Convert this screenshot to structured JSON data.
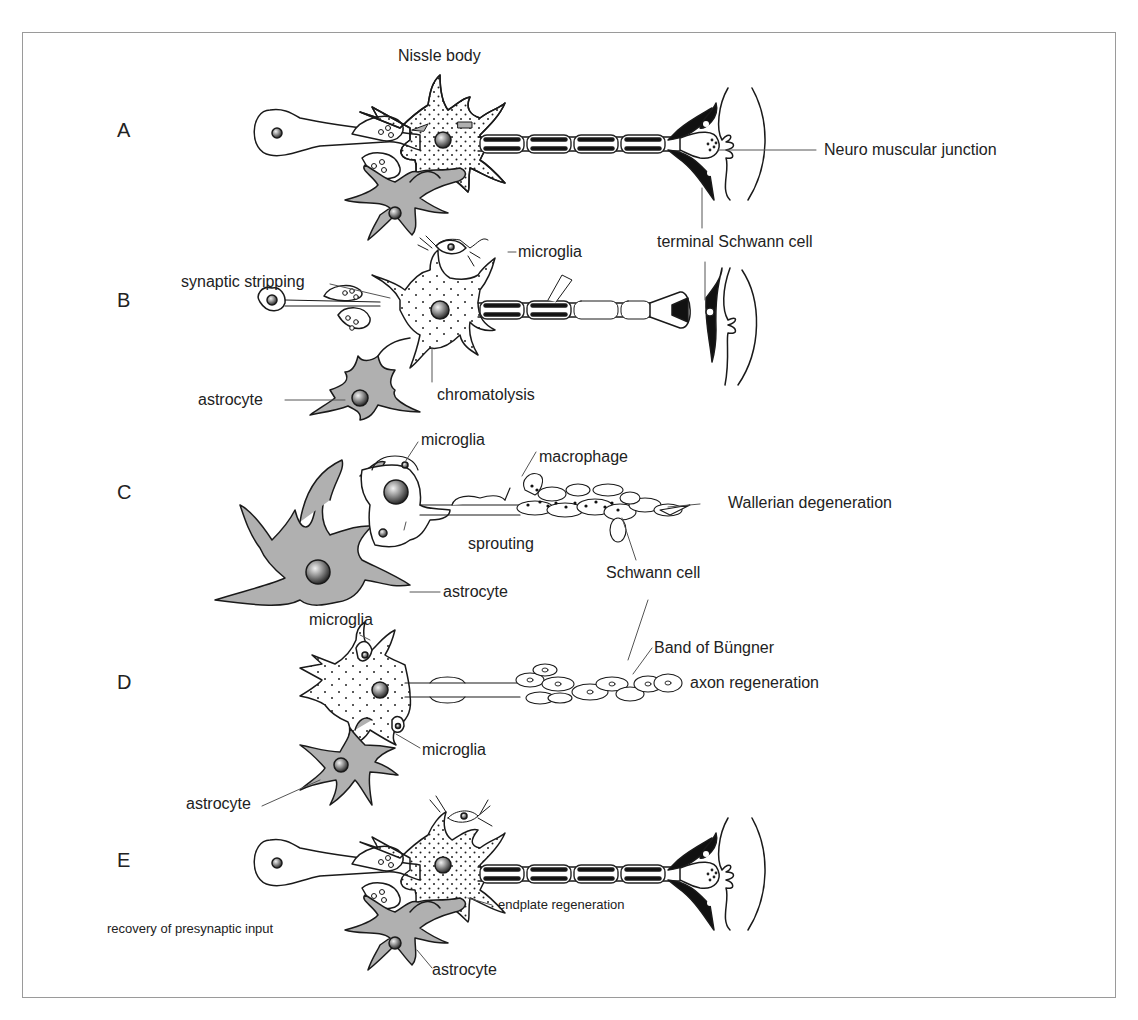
{
  "figure": {
    "rows": [
      {
        "letter": "A",
        "labels": {
          "nissle_body": "Nissle body",
          "nmj": "Neuro muscular junction",
          "terminal_schwann": "terminal Schwann cell"
        }
      },
      {
        "letter": "B",
        "labels": {
          "microglia": "microglia",
          "synaptic_stripping": "synaptic stripping",
          "astrocyte": "astrocyte",
          "chromatolysis": "chromatolysis"
        }
      },
      {
        "letter": "C",
        "labels": {
          "microglia": "microglia",
          "macrophage": "macrophage",
          "wallerian": "Wallerian degeneration",
          "sprouting": "sprouting",
          "astrocyte": "astrocyte",
          "schwann_cell": "Schwann cell"
        }
      },
      {
        "letter": "D",
        "labels": {
          "microglia_top": "microglia",
          "band_of_bungner": "Band of Büngner",
          "axon_regeneration": "axon regeneration",
          "microglia_bottom": "microglia",
          "astrocyte": "astrocyte"
        }
      },
      {
        "letter": "E",
        "labels": {
          "endplate_regeneration": "endplate regeneration",
          "recovery": "recovery of presynaptic input",
          "astrocyte": "astrocyte"
        }
      }
    ],
    "colors": {
      "astrocyte_fill": "#b0b0b0",
      "line": "#1a1a1a",
      "frame": "#9a9a9a",
      "terminal_schwann_fill": "#111111"
    }
  }
}
